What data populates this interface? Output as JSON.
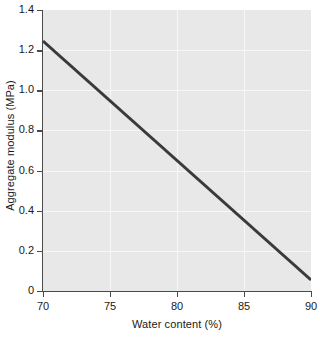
{
  "chart_data": {
    "type": "line",
    "title": "",
    "xlabel": "Water content (%)",
    "ylabel": "Aggregate modulus (MPa)",
    "xlim": [
      70,
      90
    ],
    "ylim": [
      0,
      1.4
    ],
    "xticks": [
      70,
      75,
      80,
      85,
      90
    ],
    "xtick_labels": [
      "70",
      "75",
      "80",
      "85",
      "90"
    ],
    "yticks": [
      0,
      0.2,
      0.4,
      0.6,
      0.8,
      1.0,
      1.2,
      1.4
    ],
    "ytick_labels": [
      "0",
      "0.2",
      "0.4",
      "0.6",
      "0.8",
      "1.0",
      "1.2",
      "1.4"
    ],
    "grid": true,
    "legend": "none",
    "series": [
      {
        "name": "Aggregate modulus vs water content",
        "x": [
          70,
          90
        ],
        "values": [
          1.245,
          0.055
        ],
        "color": "#3a3a3a",
        "line_width": 3
      }
    ],
    "annotations": [],
    "plot_background": "#e8e8e8",
    "grid_color": "#f7f7f7",
    "axis_color": "#4a4a4a",
    "figure_background": "#ffffff"
  }
}
